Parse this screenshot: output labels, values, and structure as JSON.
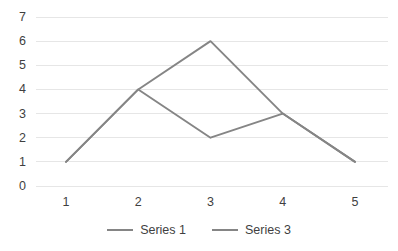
{
  "chart_data": {
    "type": "line",
    "title": "",
    "xlabel": "",
    "ylabel": "",
    "x": [
      1,
      2,
      3,
      4,
      5
    ],
    "categories": [
      "1",
      "2",
      "3",
      "4",
      "5"
    ],
    "series": [
      {
        "name": "Series 1",
        "values": [
          1,
          4,
          6,
          3,
          1
        ],
        "color": "#858585"
      },
      {
        "name": "Series 3",
        "values": [
          1,
          4,
          2,
          3,
          1
        ],
        "color": "#858585"
      }
    ],
    "ylim": [
      0,
      7
    ],
    "yticks": [
      0,
      1,
      2,
      3,
      4,
      5,
      6,
      7
    ],
    "ytick_labels": [
      "0",
      "1",
      "2",
      "3",
      "4",
      "5",
      "6",
      "7"
    ],
    "xtick_labels": [
      "1",
      "2",
      "3",
      "4",
      "5"
    ],
    "grid": true,
    "grid_axis": "y",
    "grid_color": "#E6E6E6",
    "legend_position": "bottom",
    "background": "#FFFFFF",
    "text_color": "#3F3F3F"
  },
  "legend": {
    "items": [
      {
        "label": "Series 1"
      },
      {
        "label": "Series 3"
      }
    ]
  },
  "axes": {
    "y": {
      "labels": [
        "7",
        "6",
        "5",
        "4",
        "3",
        "2",
        "1",
        "0"
      ]
    },
    "x": {
      "labels": [
        "1",
        "2",
        "3",
        "4",
        "5"
      ]
    }
  }
}
